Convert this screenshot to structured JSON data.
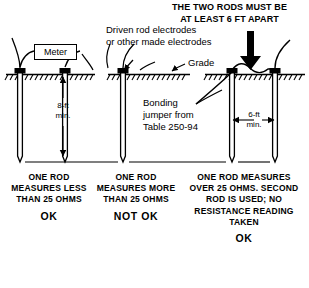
{
  "figure": {
    "heading": "THE TWO RODS MUST BE\nAT LEAST 6 FT APART",
    "labels": {
      "electrodes": "Driven rod electrodes\nor other made electrodes",
      "grade": "Grade",
      "bonding_jumper": "Bonding\njumper from\nTable 250-94",
      "meter": "Meter"
    },
    "dimensions": {
      "rod_depth": "8-ft\nmin.",
      "rod_spacing": "6-ft\nmin."
    },
    "panels": [
      {
        "id": "panel-one-rod-less-than-25",
        "caption": "ONE\nROD\nMEASURES\nLESS\nTHAN\n25\nOHMS",
        "verdict": "OK"
      },
      {
        "id": "panel-one-rod-more-than-25",
        "caption": "ONE\nROD\nMEASURES\nMORE\nTHAN\n25\nOHMS",
        "verdict": "NOT  OK"
      },
      {
        "id": "panel-second-rod-added",
        "caption": "ONE ROD\nMEASURES OVER\n25 OHMS.\nSECOND ROD\nIS USED; NO\nRESISTANCE\nREADING TAKEN",
        "verdict": "OK"
      }
    ],
    "colors": {
      "ink": "#000000",
      "background": "#ffffff"
    }
  }
}
